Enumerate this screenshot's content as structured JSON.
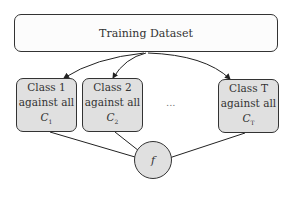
{
  "diagram": {
    "title_box": {
      "label": "Training Dataset"
    },
    "classifiers": [
      {
        "line1": "Class 1",
        "line2": "against all",
        "symbol": "C",
        "subscript": "1"
      },
      {
        "line1": "Class 2",
        "line2": "against all",
        "symbol": "C",
        "subscript": "2"
      },
      {
        "line1": "Class T",
        "line2": "against all",
        "symbol": "C",
        "subscript": "T"
      }
    ],
    "ellipsis": "...",
    "output_node": {
      "label": "f"
    },
    "colors": {
      "node_fill": "#e0e0e0",
      "border": "#333333",
      "top_fill": "#fcfcfc"
    }
  }
}
